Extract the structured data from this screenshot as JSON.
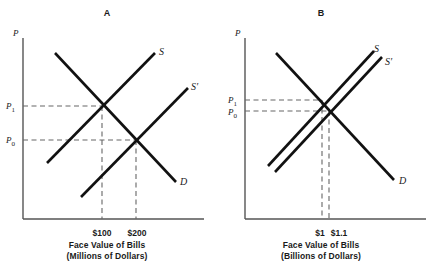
{
  "figure": {
    "kind": "supply-demand-diagram",
    "stroke_color": "#111111",
    "axis_color": "#555555",
    "guide_color": "#666666",
    "background": "#ffffff"
  },
  "panels": [
    {
      "title": "A",
      "y_axis_label": "P",
      "caption_line1": "Face Value of Bills",
      "caption_line2": "(Millions of Dollars)",
      "price_labels": [
        {
          "base": "P",
          "sub": "1"
        },
        {
          "base": "P",
          "sub": "0"
        }
      ],
      "curve_labels": [
        {
          "base": "S",
          "prime": ""
        },
        {
          "base": "S",
          "prime": "′"
        },
        {
          "base": "D",
          "prime": ""
        }
      ],
      "x_tick_labels": [
        "$100",
        "$200"
      ]
    },
    {
      "title": "B",
      "y_axis_label": "P",
      "caption_line1": "Face Value of Bills",
      "caption_line2": "(Billions of Dollars)",
      "price_labels": [
        {
          "base": "P",
          "sub": "1"
        },
        {
          "base": "P",
          "sub": "0"
        }
      ],
      "curve_labels": [
        {
          "base": "S",
          "prime": ""
        },
        {
          "base": "S",
          "prime": "′"
        },
        {
          "base": "D",
          "prime": ""
        }
      ],
      "x_tick_labels": [
        "$1",
        "$1.1"
      ]
    }
  ]
}
